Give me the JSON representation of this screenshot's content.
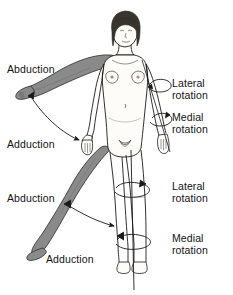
{
  "labels": {
    "arm_abduction": "Abduction",
    "arm_adduction": "Adduction",
    "leg_abduction": "Abduction",
    "leg_adduction": "Adduction",
    "arm_lateral_rotation": "Lateral\nrotation",
    "arm_medial_rotation": "Medial\nrotation",
    "leg_lateral_rotation": "Lateral\nrotation",
    "leg_medial_rotation": "Medial\nrotation"
  },
  "colors": {
    "background": "#ffffff",
    "outline": "#1a1a1a",
    "body_fill": "#fdfcf8",
    "shaded_limb": "#8a8a8a",
    "shaded_limb_dark": "#6f6f6f",
    "hair": "#3a342f",
    "text": "#121212"
  },
  "parts": {
    "head": "head-with-bobbed-hair",
    "torso": "female-torso-anterior",
    "shaded_arm": "abducted-right-arm-shaded",
    "resting_arm": "adducted-right-arm-outline",
    "left_arm": "left-arm-with-rotation-arrows",
    "shaded_leg": "abducted-right-leg-shaded",
    "stance_legs": "legs-with-rotation-arrows",
    "rotation_axis": "vertical-rotation-axis-line"
  }
}
